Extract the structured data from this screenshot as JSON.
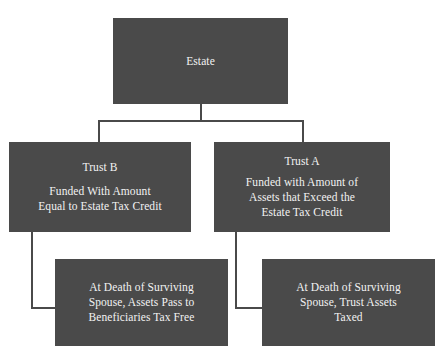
{
  "diagram": {
    "box_fill_color": "#4a4a4a",
    "box_text_color": "#f2f2f2",
    "connector_color": "#4a4a4a",
    "background_color": "#ffffff"
  },
  "nodes": {
    "estate": {
      "name": "Estate",
      "lines": [
        "Estate"
      ]
    },
    "trust_b": {
      "title": "Trust B",
      "lines": [
        "Funded With Amount",
        "Equal to Estate Tax Credit"
      ]
    },
    "trust_a": {
      "title": "Trust A",
      "lines": [
        "Funded with Amount of",
        "Assets that Exceed the",
        "Estate Tax Credit"
      ]
    },
    "outcome_b": {
      "lines": [
        "At Death of Surviving",
        "Spouse, Assets Pass to",
        "Beneficiaries Tax Free"
      ]
    },
    "outcome_a": {
      "lines": [
        "At Death of Surviving",
        "Spouse, Trust Assets",
        "Taxed"
      ]
    }
  },
  "connectors": [
    {
      "id": "root-stem",
      "from": "estate",
      "to": "bus"
    },
    {
      "id": "root-bus",
      "from": "bus",
      "to": "bus"
    },
    {
      "id": "to-trust-b",
      "from": "bus",
      "to": "trust_b"
    },
    {
      "id": "to-trust-a",
      "from": "bus",
      "to": "trust_a"
    },
    {
      "id": "b-stem",
      "from": "trust_b",
      "to": "outcome_b"
    },
    {
      "id": "b-elbow",
      "from": "trust_b",
      "to": "outcome_b"
    },
    {
      "id": "a-stem",
      "from": "trust_a",
      "to": "outcome_a"
    },
    {
      "id": "a-elbow",
      "from": "trust_a",
      "to": "outcome_a"
    }
  ]
}
